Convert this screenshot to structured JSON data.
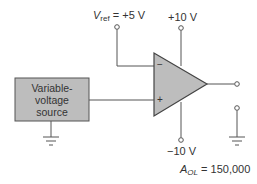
{
  "diagram": {
    "type": "op-amp comparator circuit",
    "colors": {
      "line": "#555555",
      "fill": "#bdbdbd",
      "text": "#333333"
    },
    "labels": {
      "vref_symbol": "V",
      "vref_subscript": "ref",
      "vref_value": " = +5 V",
      "positive_supply": "+10 V",
      "negative_supply": "−10 V",
      "gain_symbol": "A",
      "gain_subscript": "OL",
      "gain_value": " = 150,000",
      "inverting_input": "−",
      "noninverting_input": "+"
    },
    "source_box": {
      "lines": [
        "Variable-",
        "voltage",
        "source"
      ]
    }
  }
}
